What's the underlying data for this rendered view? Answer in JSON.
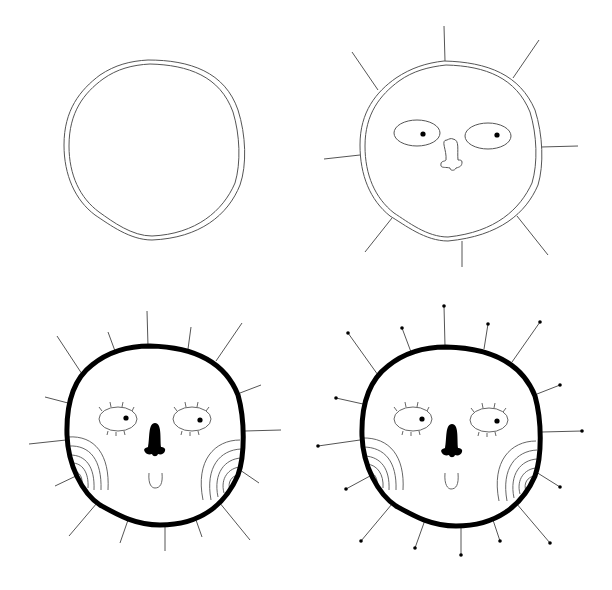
{
  "title": "How to draw a sun face – 4 steps",
  "colors": {
    "background": "#ffffff",
    "stroke": "#333333",
    "ink": "#000000"
  },
  "steps": [
    {
      "label": "Step 1: double circle outline"
    },
    {
      "label": "Step 2: rays, eyes and nose"
    },
    {
      "label": "Step 3: bold outline, lashes, cheeks and smile"
    },
    {
      "label": "Step 4: dots at the tips of the rays"
    }
  ]
}
